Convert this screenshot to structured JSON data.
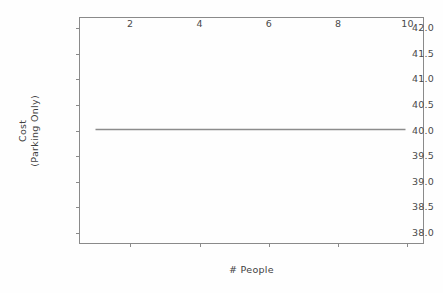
{
  "chart_data": {
    "type": "line",
    "title": "",
    "xlabel": "# People",
    "ylabel_lines": [
      "Cost",
      "(Parking Only)"
    ],
    "ylabel": "Cost (Parking Only)",
    "x": [
      1,
      2,
      3,
      4,
      5,
      6,
      7,
      8,
      9,
      10
    ],
    "values": [
      40.0,
      40.0,
      40.0,
      40.0,
      40.0,
      40.0,
      40.0,
      40.0,
      40.0,
      40.0
    ],
    "series": [
      {
        "name": "Cost (Parking Only)",
        "values": [
          40.0,
          40.0,
          40.0,
          40.0,
          40.0,
          40.0,
          40.0,
          40.0,
          40.0,
          40.0
        ],
        "color": "#8c8c8c"
      }
    ],
    "xlim": [
      0.55,
      10.45
    ],
    "ylim": [
      37.8,
      42.2
    ],
    "xticks": [
      2,
      4,
      6,
      8,
      10
    ],
    "xtick_labels": [
      "2",
      "4",
      "6",
      "8",
      "10"
    ],
    "yticks": [
      38.0,
      38.5,
      39.0,
      39.5,
      40.0,
      40.5,
      41.0,
      41.5,
      42.0
    ],
    "ytick_labels": [
      "38.0",
      "38.5",
      "39.0",
      "39.5",
      "40.0",
      "40.5",
      "41.0",
      "41.5",
      "42.0"
    ],
    "grid": false,
    "legend": null,
    "legend_position": "none",
    "line_color": "#8c8c8c",
    "axis_color": "#8a8a8a",
    "background_color": "#fefefe"
  }
}
